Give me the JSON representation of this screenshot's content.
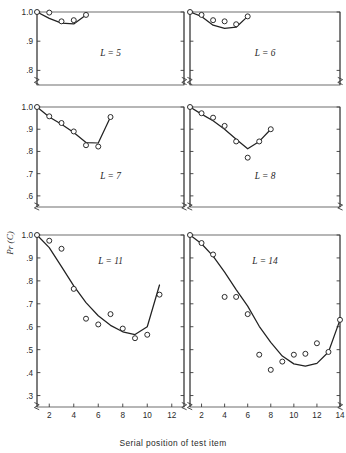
{
  "figure": {
    "xlabel": "Serial position of test item",
    "ylabel": "Pr (C)",
    "background": "#ffffff",
    "ink": "#222222"
  },
  "chart_data": {
    "type": "line",
    "title": "",
    "xlabel": "Serial position of test item",
    "ylabel": "Pr (C)",
    "grid": false,
    "legend": null,
    "marker": "open-circle",
    "note": "Six small-multiple panels of probability correct vs serial position of test item, for list lengths L. Each panel shows observed data points (open circles) and a fitted theoretical curve (solid line). Y axes are broken below the lowest labeled tick.",
    "panels": [
      {
        "label": "L = 5",
        "row": 0,
        "col": 0,
        "xlim": [
          1,
          13
        ],
        "ylim": [
          0.75,
          1.0
        ],
        "yticks": [
          1.0,
          0.9,
          0.8
        ],
        "yticklabels": [
          "1.0",
          ".9",
          ".8"
        ],
        "xticks": [],
        "xticklabels": [],
        "axis_break": true,
        "x": [
          1,
          2,
          3,
          4,
          5
        ],
        "values": [
          1.0,
          0.998,
          0.968,
          0.972,
          0.99
        ],
        "curve": [
          [
            1,
            1.0
          ],
          [
            2,
            0.978
          ],
          [
            3,
            0.962
          ],
          [
            4,
            0.959
          ],
          [
            5,
            0.99
          ]
        ]
      },
      {
        "label": "L = 6",
        "row": 0,
        "col": 1,
        "xlim": [
          1,
          14
        ],
        "ylim": [
          0.75,
          1.0
        ],
        "yticks": [
          1.0,
          0.9,
          0.8
        ],
        "yticklabels": [
          "",
          "",
          ""
        ],
        "xticks": [],
        "xticklabels": [],
        "axis_break": true,
        "x": [
          1,
          2,
          3,
          4,
          5,
          6
        ],
        "values": [
          1.0,
          0.99,
          0.972,
          0.968,
          0.958,
          0.985
        ],
        "curve": [
          [
            1,
            1.0
          ],
          [
            2,
            0.985
          ],
          [
            3,
            0.955
          ],
          [
            4,
            0.944
          ],
          [
            5,
            0.948
          ],
          [
            6,
            0.985
          ]
        ]
      },
      {
        "label": "L = 7",
        "row": 1,
        "col": 0,
        "xlim": [
          1,
          13
        ],
        "ylim": [
          0.55,
          1.0
        ],
        "yticks": [
          1.0,
          0.9,
          0.8,
          0.7,
          0.6
        ],
        "yticklabels": [
          "1.0",
          ".9",
          ".8",
          ".7",
          ".6"
        ],
        "xticks": [],
        "xticklabels": [],
        "axis_break": true,
        "x": [
          1,
          2,
          3,
          4,
          5,
          6,
          7
        ],
        "values": [
          1.0,
          0.958,
          0.928,
          0.89,
          0.828,
          0.822,
          0.955
        ],
        "curve": [
          [
            1,
            1.0
          ],
          [
            2,
            0.955
          ],
          [
            3,
            0.922
          ],
          [
            4,
            0.885
          ],
          [
            5,
            0.84
          ],
          [
            6,
            0.838
          ],
          [
            7,
            0.955
          ]
        ]
      },
      {
        "label": "L = 8",
        "row": 1,
        "col": 1,
        "xlim": [
          1,
          14
        ],
        "ylim": [
          0.55,
          1.0
        ],
        "yticks": [
          1.0,
          0.9,
          0.8,
          0.7,
          0.6
        ],
        "yticklabels": [
          "",
          "",
          "",
          "",
          ""
        ],
        "xticks": [],
        "xticklabels": [],
        "axis_break": true,
        "x": [
          1,
          2,
          3,
          4,
          5,
          6,
          7,
          8
        ],
        "values": [
          1.0,
          0.972,
          0.952,
          0.915,
          0.845,
          0.772,
          0.845,
          0.9
        ],
        "curve": [
          [
            1,
            1.0
          ],
          [
            2,
            0.968
          ],
          [
            3,
            0.938
          ],
          [
            4,
            0.9
          ],
          [
            5,
            0.855
          ],
          [
            6,
            0.812
          ],
          [
            7,
            0.845
          ],
          [
            8,
            0.9
          ]
        ]
      },
      {
        "label": "L = 11",
        "row": 2,
        "col": 0,
        "xlim": [
          1,
          13
        ],
        "ylim": [
          0.25,
          1.0
        ],
        "yticks": [
          1.0,
          0.9,
          0.8,
          0.7,
          0.6,
          0.5,
          0.4,
          0.3
        ],
        "yticklabels": [
          "1.0",
          ".9",
          ".8",
          ".7",
          ".6",
          ".5",
          ".4",
          ".3"
        ],
        "xticks": [
          2,
          4,
          6,
          8,
          10,
          12
        ],
        "xticklabels": [
          "2",
          "4",
          "6",
          "8",
          "10",
          "12"
        ],
        "axis_break": true,
        "x": [
          1,
          2,
          3,
          4,
          5,
          6,
          7,
          8,
          9,
          10,
          11
        ],
        "values": [
          1.0,
          0.975,
          0.94,
          0.765,
          0.635,
          0.61,
          0.655,
          0.592,
          0.55,
          0.565,
          0.74
        ],
        "curve": [
          [
            1,
            1.0
          ],
          [
            2,
            0.945
          ],
          [
            3,
            0.862
          ],
          [
            4,
            0.778
          ],
          [
            5,
            0.705
          ],
          [
            6,
            0.648
          ],
          [
            7,
            0.606
          ],
          [
            8,
            0.578
          ],
          [
            9,
            0.566
          ],
          [
            10,
            0.6
          ],
          [
            11,
            0.782
          ]
        ]
      },
      {
        "label": "L = 14",
        "row": 2,
        "col": 1,
        "xlim": [
          1,
          14
        ],
        "ylim": [
          0.25,
          1.0
        ],
        "yticks": [
          1.0,
          0.9,
          0.8,
          0.7,
          0.6,
          0.5,
          0.4,
          0.3
        ],
        "yticklabels": [
          "",
          "",
          "",
          "",
          "",
          "",
          "",
          ""
        ],
        "xticks": [
          2,
          4,
          6,
          8,
          10,
          12,
          14
        ],
        "xticklabels": [
          "2",
          "4",
          "6",
          "8",
          "10",
          "12",
          "14"
        ],
        "axis_break": true,
        "x": [
          1,
          2,
          3,
          4,
          5,
          6,
          7,
          8,
          9,
          10,
          11,
          12,
          13,
          14
        ],
        "values": [
          1.0,
          0.965,
          0.915,
          0.73,
          0.73,
          0.655,
          0.478,
          0.412,
          0.448,
          0.478,
          0.482,
          0.528,
          0.49,
          0.63
        ],
        "curve": [
          [
            1,
            1.0
          ],
          [
            2,
            0.962
          ],
          [
            3,
            0.908
          ],
          [
            4,
            0.838
          ],
          [
            5,
            0.762
          ],
          [
            6,
            0.69
          ],
          [
            7,
            0.602
          ],
          [
            8,
            0.532
          ],
          [
            9,
            0.472
          ],
          [
            10,
            0.438
          ],
          [
            11,
            0.428
          ],
          [
            12,
            0.44
          ],
          [
            13,
            0.49
          ],
          [
            14,
            0.63
          ]
        ]
      }
    ]
  }
}
